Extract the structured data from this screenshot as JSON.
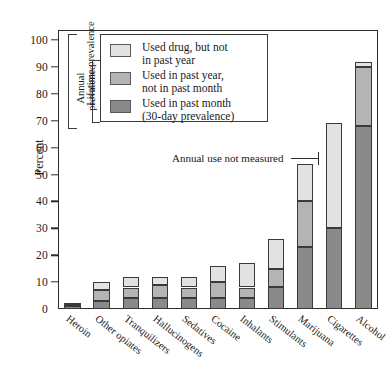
{
  "chart_data": {
    "type": "bar",
    "subtype": "stacked-bar",
    "title": "",
    "xlabel": "",
    "ylabel": "Percent",
    "ylim": [
      0,
      100
    ],
    "yticks": [
      0,
      10,
      20,
      30,
      40,
      50,
      60,
      70,
      80,
      90,
      100
    ],
    "grid": false,
    "legend_position": "upper-left-inside",
    "categories": [
      "Heroin",
      "Other opiates",
      "Tranquilizers",
      "Hallucinogens",
      "Sedatives",
      "Cocaine",
      "Inhalants",
      "Stimulants",
      "Marijuana",
      "Cigarettes",
      "Alcohol"
    ],
    "series": [
      {
        "name": "Used in past month (30-day prevalence)",
        "key": "past_month",
        "color": "#8a8a8a",
        "values": [
          1,
          3,
          4,
          4,
          4,
          4,
          4,
          8,
          23,
          30,
          68
        ]
      },
      {
        "name": "Used in past year, not in past month",
        "key": "past_year_not_month",
        "color": "#b4b4b4",
        "values": [
          0.5,
          4,
          4,
          5,
          4,
          6,
          4,
          7,
          17,
          0,
          22
        ]
      },
      {
        "name": "Used drug, but not in past year",
        "key": "not_past_year",
        "color": "#e2e2e2",
        "values": [
          0.7,
          3,
          4,
          3,
          4,
          6,
          9,
          11,
          14,
          39,
          2
        ]
      }
    ],
    "totals": [
      2.2,
      10,
      12,
      12,
      12,
      16,
      17,
      26,
      54,
      69,
      92
    ],
    "annotations": [
      {
        "text": "Annual use not measured",
        "points_to": "Cigarettes"
      }
    ],
    "brackets": [
      {
        "label": "Lifetime prevalence"
      },
      {
        "label": "Annual\nprevalence"
      }
    ]
  },
  "legend": {
    "items": [
      {
        "swatch": "light",
        "text": "Used drug, but not\nin past year"
      },
      {
        "swatch": "mid",
        "text": "Used in past year,\nnot in past month"
      },
      {
        "swatch": "dark",
        "text": "Used in past month\n(30-day prevalence)"
      }
    ]
  }
}
